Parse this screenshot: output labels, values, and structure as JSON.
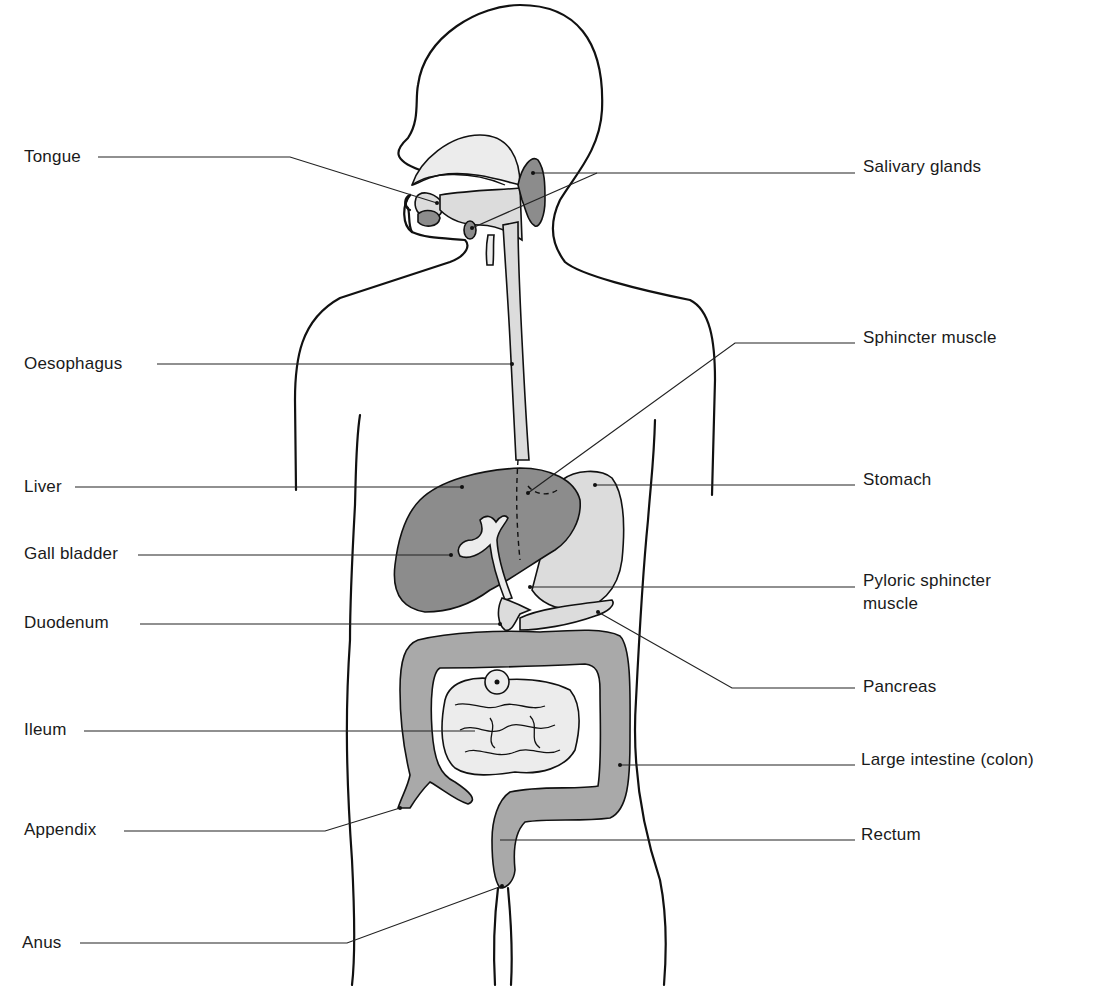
{
  "diagram": {
    "type": "anatomical",
    "colors": {
      "background": "#ffffff",
      "outline": "#111111",
      "dark_organ": "#8c8c8c",
      "mid_organ": "#a9a9a9",
      "light_organ": "#dcdcdc",
      "label_text": "#1a1a1a"
    },
    "labels_left": [
      {
        "id": "tongue",
        "text": "Tongue"
      },
      {
        "id": "oesophagus",
        "text": "Oesophagus"
      },
      {
        "id": "liver",
        "text": "Liver"
      },
      {
        "id": "gall_bladder",
        "text": "Gall bladder"
      },
      {
        "id": "duodenum",
        "text": "Duodenum"
      },
      {
        "id": "ileum",
        "text": "Ileum"
      },
      {
        "id": "appendix",
        "text": "Appendix"
      },
      {
        "id": "anus",
        "text": "Anus"
      }
    ],
    "labels_right": [
      {
        "id": "salivary_glands",
        "text": "Salivary glands"
      },
      {
        "id": "sphincter_muscle",
        "text": "Sphincter muscle"
      },
      {
        "id": "stomach",
        "text": "Stomach"
      },
      {
        "id": "pyloric_sphincter",
        "text": "Pyloric sphincter",
        "text_line2": "muscle"
      },
      {
        "id": "pancreas",
        "text": "Pancreas"
      },
      {
        "id": "large_intestine",
        "text": "Large intestine (colon)"
      },
      {
        "id": "rectum",
        "text": "Rectum"
      }
    ]
  }
}
